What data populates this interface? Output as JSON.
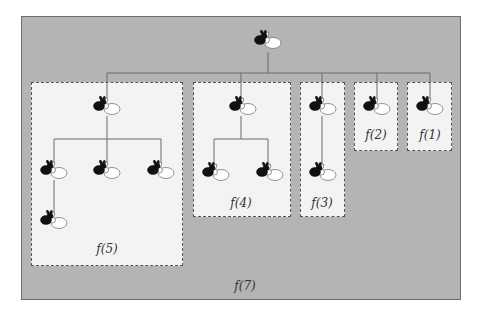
{
  "diagram": {
    "outer_label": "f(7)",
    "colors": {
      "outer_bg": "#b4b4b4",
      "box_bg": "#f3f3f3",
      "box_border": "#555555",
      "line": "#6a6a6a",
      "rabbit_black": "#111111",
      "rabbit_white_outline": "#777777"
    },
    "root": {
      "icon": "rabbit-pair-icon",
      "x": 253,
      "y": 30
    },
    "boxes": [
      {
        "id": "f5",
        "label": "f(5)",
        "x": 31,
        "y": 82,
        "w": 152,
        "h": 184,
        "label_x": 107,
        "label_y": 242,
        "rabbits": [
          {
            "x": 92,
            "y": 96
          },
          {
            "x": 39,
            "y": 160
          },
          {
            "x": 92,
            "y": 160
          },
          {
            "x": 146,
            "y": 160
          },
          {
            "x": 39,
            "y": 210
          }
        ]
      },
      {
        "id": "f4",
        "label": "f(4)",
        "x": 193,
        "y": 82,
        "w": 98,
        "h": 135,
        "label_x": 241,
        "label_y": 196,
        "rabbits": [
          {
            "x": 228,
            "y": 96
          },
          {
            "x": 201,
            "y": 162
          },
          {
            "x": 255,
            "y": 162
          }
        ]
      },
      {
        "id": "f3",
        "label": "f(3)",
        "x": 300,
        "y": 82,
        "w": 45,
        "h": 135,
        "label_x": 322,
        "label_y": 196,
        "rabbits": [
          {
            "x": 308,
            "y": 96
          },
          {
            "x": 308,
            "y": 162
          }
        ]
      },
      {
        "id": "f2",
        "label": "f(2)",
        "x": 354,
        "y": 82,
        "w": 44,
        "h": 69,
        "label_x": 376,
        "label_y": 128,
        "rabbits": [
          {
            "x": 362,
            "y": 96
          }
        ]
      },
      {
        "id": "f1",
        "label": "f(1)",
        "x": 407,
        "y": 82,
        "w": 45,
        "h": 69,
        "label_x": 430,
        "label_y": 128,
        "rabbits": [
          {
            "x": 415,
            "y": 96
          }
        ]
      }
    ],
    "outer_label_pos": {
      "x": 245,
      "y": 279
    }
  }
}
